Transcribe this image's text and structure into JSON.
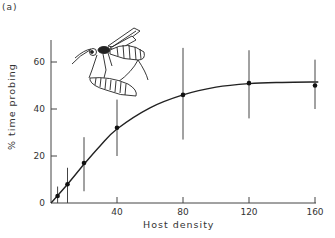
{
  "panel_label": "(a)",
  "chart_data": {
    "type": "line",
    "title": "",
    "panel": "(a)",
    "xlabel": "Host density",
    "ylabel": "% time probing",
    "xlim": [
      0,
      160
    ],
    "ylim": [
      0,
      70
    ],
    "xticks": [
      0,
      40,
      80,
      120,
      160
    ],
    "yticks": [
      0,
      20,
      40,
      60
    ],
    "xtick_labels": [
      "40",
      "80",
      "120",
      "160"
    ],
    "ytick_labels": [
      "0",
      "20",
      "40",
      "60"
    ],
    "grid": false,
    "legend": null,
    "series": [
      {
        "name": "observed",
        "style": "points-with-error-bars",
        "x": [
          4,
          10,
          20,
          40,
          80,
          120,
          160
        ],
        "y": [
          3,
          8,
          17,
          32,
          46,
          51,
          50
        ],
        "err_low": [
          0,
          0,
          5,
          20,
          27,
          36,
          40
        ],
        "err_high": [
          7,
          15,
          28,
          44,
          66,
          65,
          61
        ]
      },
      {
        "name": "fitted curve",
        "style": "smooth-line",
        "x": [
          0,
          10,
          20,
          30,
          40,
          60,
          80,
          100,
          120,
          140,
          162
        ],
        "y": [
          0,
          8,
          16.5,
          24.5,
          31.5,
          40.5,
          46,
          49.3,
          50.8,
          51.3,
          51.5
        ]
      }
    ],
    "annotations": [
      "Illustration of parasitoid wasp probing a host larva (upper left)"
    ]
  }
}
